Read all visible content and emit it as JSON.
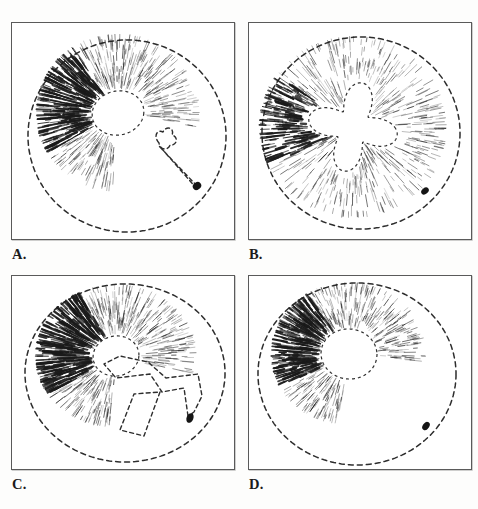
{
  "figure": {
    "type": "scientific-plate",
    "background_color": "#fdfdfc",
    "ink_color": "#1b1b1b",
    "frame_color": "#5a5a5a",
    "width": 478,
    "height": 509,
    "columns": 2,
    "rows": 2
  },
  "panels": [
    {
      "id": "panel-a",
      "label": "A.",
      "frame": {
        "x": 11,
        "y": 22,
        "w": 224,
        "h": 218
      },
      "label_pos": {
        "x": 11,
        "y": 243
      },
      "outline": {
        "shape": "spiral-round",
        "cx": 115,
        "cy": 113,
        "rx": 99,
        "ry": 96,
        "dash": "5,4",
        "stroke_width": 1.5,
        "notch": "lower-right-inward-sweep"
      },
      "pith": {
        "shape": "oval",
        "cx": 106,
        "cy": 90,
        "rx": 26,
        "ry": 22,
        "rotation": -12
      },
      "rays": {
        "count": 300,
        "inner_radius_factor": 1.05,
        "outer_radius_factor": 0.82,
        "angle_start": 95,
        "angle_end": 370,
        "dense_sector": [
          150,
          235
        ],
        "max_stroke": 2.2
      },
      "branch": {
        "shape": "bone-hook",
        "path_name": "short-club-arm",
        "anchor": {
          "x": 185,
          "y": 163
        }
      },
      "marker": {
        "shape": "ellipse-dark",
        "cx": 185,
        "cy": 163,
        "rx": 4.5,
        "ry": 3.6,
        "rotation": -35,
        "color": "#151515"
      }
    },
    {
      "id": "panel-b",
      "label": "B.",
      "frame": {
        "x": 248,
        "y": 22,
        "w": 224,
        "h": 218
      },
      "label_pos": {
        "x": 248,
        "y": 243
      },
      "outline": {
        "shape": "round",
        "cx": 112,
        "cy": 110,
        "rx": 99,
        "ry": 96,
        "dash": "5,4",
        "stroke_width": 1.5,
        "notch": "none"
      },
      "pith": {
        "shape": "x-star",
        "cx": 104,
        "cy": 104,
        "rx": 46,
        "ry": 44,
        "arms": 4,
        "rotation": 12
      },
      "rays": {
        "count": 300,
        "inner_radius_factor": 1.08,
        "outer_radius_factor": 0.94,
        "angle_start": 0,
        "angle_end": 360,
        "dense_sector": [
          155,
          215
        ],
        "max_stroke": 2.4
      },
      "branch": {
        "shape": "none",
        "path_name": "",
        "anchor": {
          "x": 176,
          "y": 168
        }
      },
      "marker": {
        "shape": "ellipse-dark",
        "cx": 176,
        "cy": 168,
        "rx": 4.2,
        "ry": 3.0,
        "rotation": -40,
        "color": "#151515"
      }
    },
    {
      "id": "panel-c",
      "label": "C.",
      "frame": {
        "x": 11,
        "y": 275,
        "w": 224,
        "h": 195
      },
      "label_pos": {
        "x": 11,
        "y": 489
      },
      "outline": {
        "shape": "spiral-round",
        "cx": 113,
        "cy": 97,
        "rx": 100,
        "ry": 89,
        "dash": "5,4",
        "stroke_width": 1.5,
        "notch": "lower-right-inward-sweep"
      },
      "pith": {
        "shape": "oval",
        "cx": 104,
        "cy": 80,
        "rx": 23,
        "ry": 20,
        "rotation": -10
      },
      "rays": {
        "count": 310,
        "inner_radius_factor": 1.05,
        "outer_radius_factor": 0.8,
        "angle_start": 95,
        "angle_end": 375,
        "dense_sector": [
          150,
          240
        ],
        "max_stroke": 2.3
      },
      "branch": {
        "shape": "cross-anchor",
        "path_name": "long-cross-arm",
        "anchor": {
          "x": 178,
          "y": 142
        }
      },
      "marker": {
        "shape": "ellipse-dark",
        "cx": 178,
        "cy": 142,
        "rx": 5.0,
        "ry": 3.4,
        "rotation": -68,
        "color": "#151515"
      }
    },
    {
      "id": "panel-d",
      "label": "D.",
      "frame": {
        "x": 248,
        "y": 275,
        "w": 224,
        "h": 195
      },
      "label_pos": {
        "x": 248,
        "y": 489
      },
      "outline": {
        "shape": "spiral-round",
        "cx": 108,
        "cy": 98,
        "rx": 99,
        "ry": 91,
        "dash": "5,4",
        "stroke_width": 1.5,
        "notch": "lower-right-wide-lobe"
      },
      "pith": {
        "shape": "oval",
        "cx": 100,
        "cy": 78,
        "rx": 28,
        "ry": 25,
        "rotation": 6
      },
      "rays": {
        "count": 290,
        "inner_radius_factor": 1.05,
        "outer_radius_factor": 0.78,
        "angle_start": 100,
        "angle_end": 368,
        "dense_sector": [
          155,
          235
        ],
        "max_stroke": 2.3
      },
      "branch": {
        "shape": "lobe-sweep",
        "path_name": "lower-lobe-arc",
        "anchor": {
          "x": 177,
          "y": 150
        }
      },
      "marker": {
        "shape": "ellipse-dark",
        "cx": 177,
        "cy": 150,
        "rx": 4.6,
        "ry": 3.2,
        "rotation": -55,
        "color": "#151515"
      }
    }
  ]
}
